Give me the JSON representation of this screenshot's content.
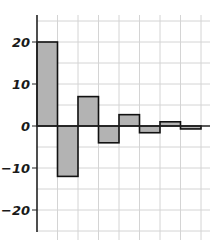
{
  "chart_data": {
    "type": "bar",
    "title": "",
    "xlabel": "",
    "ylabel": "",
    "categories": [
      "1",
      "2",
      "3",
      "4",
      "5",
      "6",
      "7",
      "8"
    ],
    "values": [
      20,
      -12,
      7,
      -4,
      2.7,
      -1.6,
      1,
      -0.7
    ],
    "ylim": [
      -25,
      25
    ],
    "yticks": [
      20,
      10,
      0,
      -10,
      -20
    ],
    "ytick_labels": [
      "20",
      "10",
      "0",
      "−10",
      "−20"
    ],
    "grid": true,
    "legend": null,
    "colors": {
      "bar_fill": "#b3b3b3",
      "bar_edge": "#111111",
      "grid": "#d4d4d4",
      "axis": "#222222"
    }
  }
}
